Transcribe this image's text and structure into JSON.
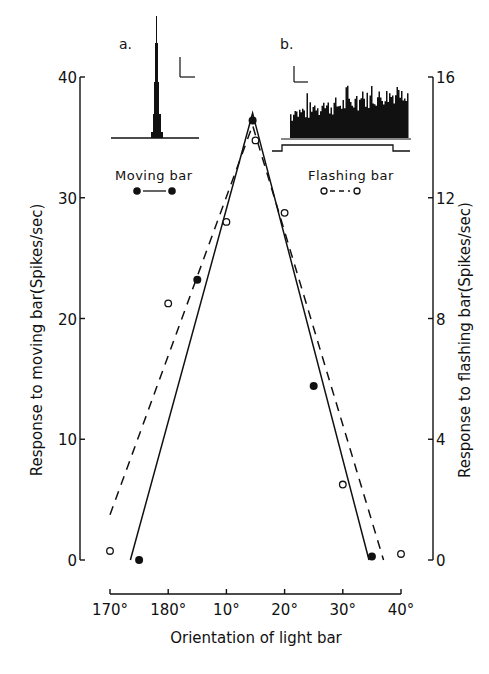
{
  "chart_data": {
    "type": "line",
    "title": "",
    "xlabel": "Orientation of light bar",
    "ylabel_left": "Response to moving bar(Spikes/sec)",
    "ylabel_right": "Response to flashing bar(Spikes/sec)",
    "x_tick_labels": [
      "170°",
      "180°",
      "10°",
      "20°",
      "30°",
      "40°"
    ],
    "x_tick_positions": [
      0,
      10,
      20,
      30,
      40,
      50
    ],
    "x_note": "x positions measured as degrees past 170° (orientation wraps 180°→0°)",
    "y_left_ticks": [
      "0",
      "10",
      "20",
      "30",
      "40"
    ],
    "y_left_range": [
      0,
      40
    ],
    "y_right_ticks": [
      "0",
      "4",
      "8",
      "12",
      "16"
    ],
    "y_right_range": [
      0,
      16
    ],
    "grid": false,
    "legend_position": "top, under insets",
    "series": [
      {
        "name": "Moving bar",
        "axis": "left",
        "marker": "filled-circle",
        "line": "solid",
        "points": [
          {
            "x_label": "175°",
            "x": 5,
            "y": 0
          },
          {
            "x_label": "5°",
            "x": 15,
            "y": 23.2
          },
          {
            "x_label": "14.5°",
            "x": 24.5,
            "y": 36.4
          },
          {
            "x_label": "25°",
            "x": 35,
            "y": 14.4
          },
          {
            "x_label": "35°",
            "x": 45,
            "y": 0.3
          }
        ],
        "fit_line": [
          [
            3.5,
            0
          ],
          [
            24.5,
            37
          ],
          [
            44.5,
            0
          ]
        ]
      },
      {
        "name": "Flashing bar",
        "axis": "right",
        "marker": "open-circle",
        "line": "dashed",
        "points": [
          {
            "x_label": "170°",
            "x": 0,
            "y": 0.3
          },
          {
            "x_label": "180°",
            "x": 10,
            "y": 8.5
          },
          {
            "x_label": "10°",
            "x": 20,
            "y": 11.2
          },
          {
            "x_label": "15°",
            "x": 25,
            "y": 13.9
          },
          {
            "x_label": "20°",
            "x": 30,
            "y": 11.5
          },
          {
            "x_label": "30°",
            "x": 40,
            "y": 2.5
          },
          {
            "x_label": "40°",
            "x": 50,
            "y": 0.2
          }
        ],
        "fit_line": [
          [
            0,
            1.5
          ],
          [
            24.5,
            14.4
          ],
          [
            47,
            0
          ]
        ]
      }
    ],
    "insets": [
      {
        "label": "a.",
        "description": "Peristimulus histogram for moving bar: single narrow sharp peak",
        "legend": "Moving bar"
      },
      {
        "label": "b.",
        "description": "Peristimulus histogram for flashing bar: sustained ragged response during stimulus step, increasing slightly over time",
        "legend": "Flashing bar"
      }
    ]
  },
  "labels": {
    "inset_a": "a.",
    "inset_b": "b.",
    "legend_moving": "Moving bar",
    "legend_flashing": "Flashing bar",
    "xlabel": "Orientation of light bar",
    "ylabel_left": "Response to moving bar(Spikes/sec)",
    "ylabel_right": "Response to flashing bar(Spikes/sec)"
  },
  "colors": {
    "ink": "#111111",
    "background": "#ffffff"
  }
}
